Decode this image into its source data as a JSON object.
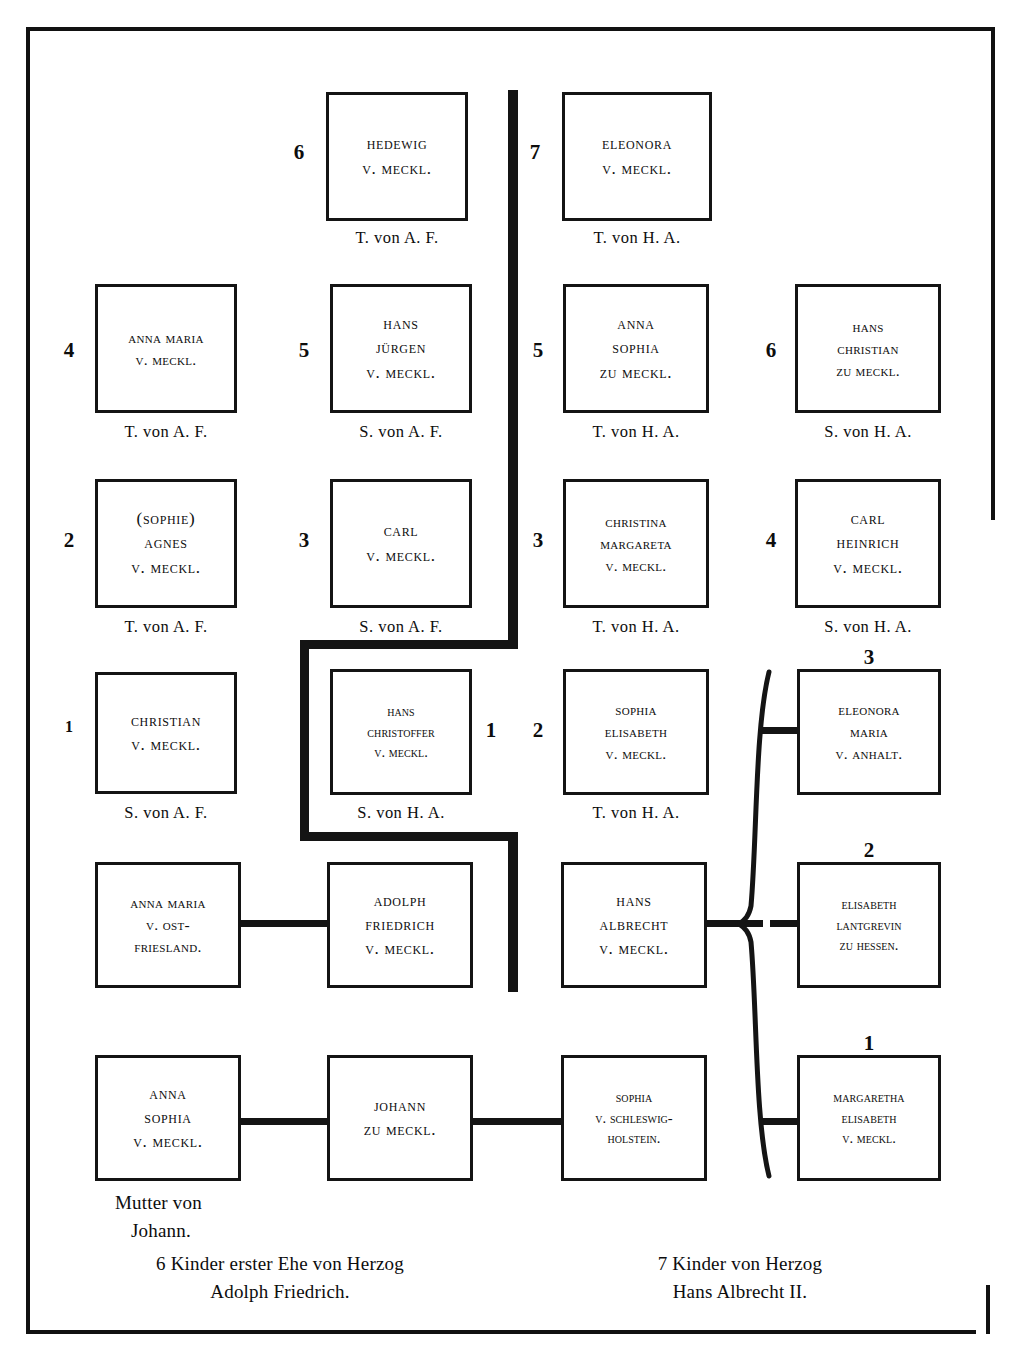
{
  "diagram": {
    "title_absent": true,
    "nodes": [
      {
        "id": "hedewig",
        "ordinal": "6",
        "lines": [
          "Hedewig",
          "v. Meckl."
        ],
        "caption": "T. von A. F."
      },
      {
        "id": "eleonora",
        "ordinal": "7",
        "lines": [
          "Eleonora",
          "v. Meckl."
        ],
        "caption": "T. von H. A."
      },
      {
        "id": "anna-maria",
        "ordinal": "4",
        "lines": [
          "Anna Maria",
          "v. Meckl."
        ],
        "caption": "T. von A. F."
      },
      {
        "id": "hans-juergen",
        "ordinal": "5",
        "lines": [
          "Hans",
          "Jürgen",
          "v. Meckl."
        ],
        "caption": "S. von A. F."
      },
      {
        "id": "anna-sophia-zu",
        "ordinal": "5",
        "lines": [
          "Anna",
          "Sophia",
          "zu Meckl."
        ],
        "caption": "T. von H. A."
      },
      {
        "id": "hans-christian",
        "ordinal": "6",
        "lines": [
          "Hans",
          "Christian",
          "zu Meckl."
        ],
        "caption": "S. von H. A."
      },
      {
        "id": "agnes",
        "ordinal": "2",
        "lines": [
          "(Sophie)",
          "Agnes",
          "v. Meckl."
        ],
        "caption": "T. von A. F."
      },
      {
        "id": "carl",
        "ordinal": "3",
        "lines": [
          "Carl",
          "v. Meckl."
        ],
        "caption": "S. von A. F."
      },
      {
        "id": "christina",
        "ordinal": "3",
        "lines": [
          "Christina",
          "Margareta",
          "v. Meckl."
        ],
        "caption": "T. von H. A."
      },
      {
        "id": "carl-heinrich",
        "ordinal": "4",
        "lines": [
          "Carl",
          "Heinrich",
          "v. Meckl."
        ],
        "caption": "S. von H. A."
      },
      {
        "id": "christian",
        "ordinal": "1",
        "lines": [
          "Christian",
          "v. Meckl."
        ],
        "caption": "S. von A. F."
      },
      {
        "id": "hans-christoffer",
        "ordinal": "1",
        "lines": [
          "Hans",
          "Christoffer",
          "v. Meckl."
        ],
        "caption": "S. von H. A."
      },
      {
        "id": "sophia-elisabeth",
        "ordinal": "2",
        "lines": [
          "Sophia",
          "Elisabeth",
          "v. Meckl."
        ],
        "caption": "T. von H. A."
      },
      {
        "id": "eleonora-maria",
        "ordinal": "3",
        "lines": [
          "Eleonora",
          "Maria",
          "v. Anhalt."
        ],
        "caption": ""
      },
      {
        "id": "anna-maria-ost",
        "ordinal": "",
        "lines": [
          "Anna Maria",
          "v. Ost-",
          "Friesland."
        ],
        "caption": ""
      },
      {
        "id": "adolph-friedrich",
        "ordinal": "",
        "lines": [
          "Adolph",
          "Friedrich",
          "v. Meckl."
        ],
        "caption": ""
      },
      {
        "id": "hans-albrecht",
        "ordinal": "",
        "lines": [
          "Hans",
          "Albrecht",
          "v. Meckl."
        ],
        "caption": ""
      },
      {
        "id": "elisabeth-hessen",
        "ordinal": "2",
        "lines": [
          "Elisabeth",
          "Lantgrevin",
          "zu Hessen."
        ],
        "caption": ""
      },
      {
        "id": "anna-sophia-v",
        "ordinal": "",
        "lines": [
          "Anna",
          "Sophia",
          "v. Meckl."
        ],
        "caption": "Mutter von\nJohann."
      },
      {
        "id": "johann",
        "ordinal": "",
        "lines": [
          "Johann",
          "zu Meckl."
        ],
        "caption": ""
      },
      {
        "id": "sophia-schleswig",
        "ordinal": "",
        "lines": [
          "Sophia",
          "v. Schleswig-",
          "Holstein."
        ],
        "caption": ""
      },
      {
        "id": "margaretha",
        "ordinal": "1",
        "lines": [
          "Margaretha",
          "Elisabeth",
          "v. Meckl."
        ],
        "caption": ""
      }
    ],
    "captions": {
      "mutter_line1": "Mutter von",
      "mutter_line2": "Johann.",
      "left_note_line1": "6 Kinder erster Ehe von Herzog",
      "left_note_line2": "Adolph Friedrich.",
      "right_note_line1": "7 Kinder von Herzog",
      "right_note_line2": "Hans Albrecht II."
    }
  }
}
